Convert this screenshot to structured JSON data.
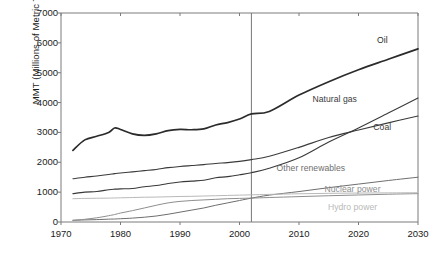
{
  "chart_data": {
    "type": "line",
    "title": "",
    "xlabel": "",
    "ylabel": "MMT (Millions of Metric Tons)",
    "xlim": [
      1970,
      2030
    ],
    "ylim": [
      0,
      7000
    ],
    "grid": false,
    "legend_position": "inline-right",
    "xticks": [
      "1970",
      "1980",
      "1990",
      "2000",
      "2010",
      "2020",
      "2030"
    ],
    "yticks": [
      "0",
      "1000",
      "2000",
      "3000",
      "4000",
      "5000",
      "6000",
      "7000"
    ],
    "annotations": [
      {
        "name": "projection-divider",
        "x": 2002,
        "note": "vertical line separating history from projection"
      }
    ],
    "x": [
      1972,
      1974,
      1976,
      1978,
      1979,
      1980,
      1982,
      1984,
      1986,
      1988,
      1990,
      1992,
      1994,
      1996,
      1998,
      2000,
      2002,
      2005,
      2010,
      2015,
      2020,
      2025,
      2030
    ],
    "series": [
      {
        "name": "Oil",
        "color": "#2b2b2b",
        "width": 1.7,
        "label_x": 2024,
        "label_y": 6050,
        "values": [
          2400,
          2750,
          2870,
          3000,
          3150,
          3100,
          2950,
          2900,
          2950,
          3060,
          3100,
          3090,
          3120,
          3250,
          3330,
          3450,
          3620,
          3700,
          4250,
          4700,
          5100,
          5450,
          5800
        ]
      },
      {
        "name": "Natural gas",
        "color": "#3a3a3a",
        "width": 1.1,
        "label_x": 2016,
        "label_y": 4100,
        "values": [
          950,
          1000,
          1020,
          1080,
          1100,
          1110,
          1120,
          1180,
          1220,
          1290,
          1340,
          1370,
          1400,
          1480,
          1520,
          1580,
          1650,
          1800,
          2150,
          2680,
          3150,
          3650,
          4150
        ]
      },
      {
        "name": "Coal",
        "color": "#3a3a3a",
        "width": 1.1,
        "label_x": 2024,
        "label_y": 3150,
        "values": [
          1450,
          1500,
          1540,
          1590,
          1620,
          1640,
          1680,
          1720,
          1760,
          1820,
          1860,
          1890,
          1920,
          1960,
          1990,
          2030,
          2090,
          2200,
          2500,
          2830,
          3080,
          3320,
          3550
        ]
      },
      {
        "name": "Other renewables",
        "color": "#6e6e6e",
        "width": 1.0,
        "label_x": 2012,
        "label_y": 1760,
        "values": [
          60,
          70,
          80,
          95,
          100,
          110,
          130,
          160,
          200,
          260,
          330,
          400,
          470,
          560,
          640,
          720,
          800,
          900,
          1020,
          1150,
          1270,
          1390,
          1500
        ]
      },
      {
        "name": "Nuclear power",
        "color": "#8e8e8e",
        "width": 1.0,
        "label_x": 2019,
        "label_y": 1070,
        "values": [
          50,
          90,
          140,
          210,
          250,
          300,
          380,
          470,
          560,
          640,
          690,
          720,
          740,
          760,
          780,
          790,
          800,
          820,
          850,
          880,
          905,
          930,
          950
        ]
      },
      {
        "name": "Hydro power",
        "color": "#b9b9b9",
        "width": 1.0,
        "label_x": 2019,
        "label_y": 480,
        "values": [
          780,
          790,
          795,
          800,
          805,
          810,
          820,
          830,
          835,
          845,
          855,
          860,
          870,
          880,
          890,
          900,
          910,
          925,
          945,
          960,
          970,
          975,
          980
        ]
      }
    ]
  },
  "axes": {
    "frame_color": "#7a7a7a",
    "divider_color": "#777777"
  }
}
